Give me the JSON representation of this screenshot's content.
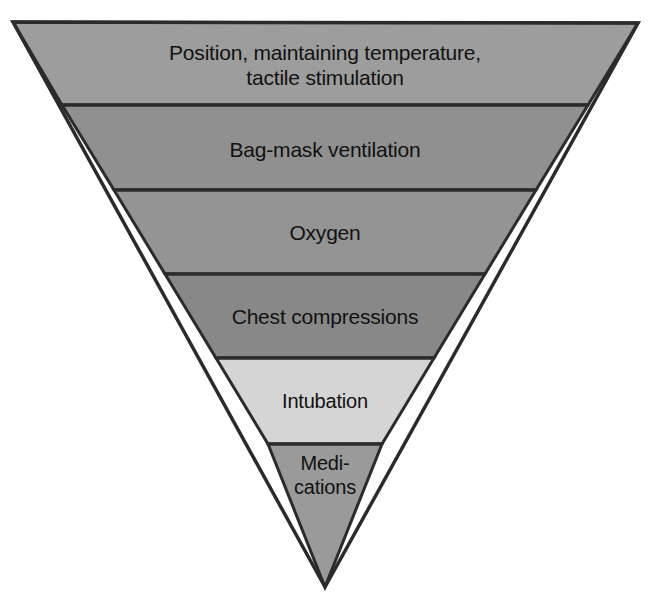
{
  "figure": {
    "shape": "inverted-triangle",
    "background_color": "#ffffff",
    "outline_color": "#2b2b2b",
    "divider_color": "#2b2b2b",
    "text_color": "#111111",
    "apex": {
      "x": 325,
      "y": 587
    },
    "top_left": {
      "x": 13,
      "y": 22
    },
    "top_right": {
      "x": 638,
      "y": 23
    },
    "divider_y": [
      105,
      190,
      274,
      358,
      444
    ]
  },
  "bands": [
    {
      "index": 1,
      "label": "Position, maintaining temperature,\ntactile stimulation",
      "fill": "#9d9d9d",
      "top_y": 22,
      "bottom_y": 105
    },
    {
      "index": 2,
      "label": "Bag-mask ventilation",
      "fill": "#909090",
      "top_y": 105,
      "bottom_y": 190
    },
    {
      "index": 3,
      "label": "Oxygen",
      "fill": "#949494",
      "top_y": 190,
      "bottom_y": 274
    },
    {
      "index": 4,
      "label": "Chest compressions",
      "fill": "#888888",
      "top_y": 274,
      "bottom_y": 358
    },
    {
      "index": 5,
      "label": "Intubation",
      "fill": "#d5d5d5",
      "top_y": 358,
      "bottom_y": 444
    },
    {
      "index": 6,
      "label": "Medi-\ncations",
      "fill": "#9a9a9a",
      "top_y": 444,
      "bottom_y": 587
    }
  ]
}
